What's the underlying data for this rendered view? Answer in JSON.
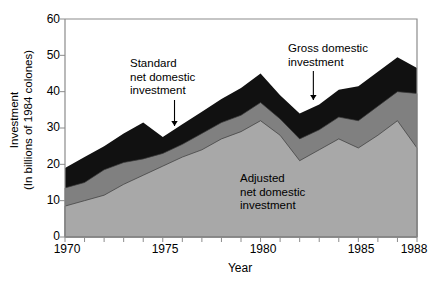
{
  "chart_data": {
    "type": "area",
    "title": "",
    "xlabel": "Year",
    "ylabel_line1": "Investment",
    "ylabel_line2": "(In billions of 1984 colones)",
    "xlim": [
      1970,
      1988
    ],
    "ylim": [
      0,
      60
    ],
    "grid": false,
    "legend_position": "inline-annotations",
    "stacked": true,
    "x": [
      1970,
      1971,
      1972,
      1973,
      1974,
      1975,
      1976,
      1977,
      1978,
      1979,
      1980,
      1981,
      1982,
      1983,
      1984,
      1985,
      1986,
      1987,
      1988
    ],
    "xticks": [
      1970,
      1975,
      1980,
      1985,
      1988
    ],
    "xtick_labels": [
      "1970",
      "1975",
      "1980",
      "1985",
      "1988"
    ],
    "yticks": [
      0,
      10,
      20,
      30,
      40,
      50,
      60
    ],
    "ytick_labels": [
      "0",
      "10",
      "20",
      "30",
      "40",
      "50",
      "60"
    ],
    "series": [
      {
        "name": "Adjusted net domestic investment",
        "color": "#a8a8a8",
        "cumulative_top": [
          8.5,
          10.0,
          11.5,
          14.5,
          17.0,
          19.5,
          22.0,
          24.0,
          27.0,
          29.0,
          32.0,
          28.0,
          21.0,
          24.0,
          27.0,
          24.5,
          28.0,
          32.0,
          24.5
        ],
        "values": [
          8.5,
          10.0,
          11.5,
          14.5,
          17.0,
          19.5,
          22.0,
          24.0,
          27.0,
          29.0,
          32.0,
          28.0,
          21.0,
          24.0,
          27.0,
          24.5,
          28.0,
          32.0,
          24.5
        ]
      },
      {
        "name": "Standard net domestic investment",
        "color": "#808080",
        "cumulative_top": [
          13.5,
          15.0,
          18.5,
          20.5,
          21.5,
          23.0,
          25.5,
          28.5,
          31.5,
          33.5,
          37.0,
          32.5,
          27.0,
          29.5,
          33.0,
          32.0,
          36.0,
          40.0,
          39.5
        ],
        "values": [
          5.0,
          5.0,
          7.0,
          6.0,
          4.5,
          3.5,
          3.5,
          4.5,
          4.5,
          4.5,
          5.0,
          4.5,
          6.0,
          5.5,
          6.0,
          7.5,
          8.0,
          8.0,
          15.0
        ]
      },
      {
        "name": "Gross domestic investment",
        "color": "#111111",
        "cumulative_top": [
          19.0,
          22.0,
          25.0,
          28.5,
          31.5,
          27.5,
          31.0,
          34.5,
          38.0,
          41.0,
          45.0,
          39.0,
          34.0,
          36.5,
          40.5,
          41.5,
          45.5,
          49.5,
          46.5
        ],
        "values": [
          5.5,
          7.0,
          6.5,
          8.0,
          10.0,
          4.5,
          5.5,
          6.0,
          6.5,
          7.5,
          8.0,
          6.5,
          7.0,
          7.0,
          7.5,
          9.5,
          9.5,
          9.5,
          7.0
        ]
      }
    ],
    "annotations": [
      {
        "id": "standard-net-domestic-investment",
        "lines": [
          "Standard",
          "net domestic",
          "investment"
        ],
        "target_x": 1975.6,
        "has_arrow": true
      },
      {
        "id": "gross-domestic-investment",
        "lines": [
          "Gross domestic",
          "investment"
        ],
        "target_x": 1982.7,
        "has_arrow": true
      },
      {
        "id": "adjusted-net-domestic-investment",
        "lines": [
          "Adjusted",
          "net domestic",
          "investment"
        ],
        "target_x": null,
        "has_arrow": false
      }
    ],
    "colors": {
      "adjusted": "#a8a8a8",
      "standard": "#808080",
      "gross": "#111111",
      "axis": "#8c8c8c",
      "text": "#000000",
      "background": "#ffffff"
    }
  },
  "axes": {
    "y_ticks": [
      {
        "label": "60"
      },
      {
        "label": "50"
      },
      {
        "label": "40"
      },
      {
        "label": "30"
      },
      {
        "label": "20"
      },
      {
        "label": "10"
      },
      {
        "label": "0"
      }
    ],
    "x_ticks": [
      {
        "label": "1970"
      },
      {
        "label": "1975"
      },
      {
        "label": "1980"
      },
      {
        "label": "1985"
      },
      {
        "label": "1988"
      }
    ],
    "x_title": "Year",
    "y_title_line1": "Investment",
    "y_title_line2": "(In billions of 1984 colones)"
  },
  "annotations": {
    "standard": {
      "l1": "Standard",
      "l2": "net domestic",
      "l3": "investment"
    },
    "gross": {
      "l1": "Gross domestic",
      "l2": "investment"
    },
    "adjusted": {
      "l1": "Adjusted",
      "l2": "net domestic",
      "l3": "investment"
    }
  }
}
